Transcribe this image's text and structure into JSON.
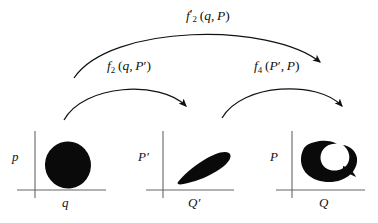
{
  "figure": {
    "background_color": "#ffffff",
    "ink_color": "#000000",
    "axis_color": "#555555"
  },
  "arrows": [
    {
      "name": "arrow-top-f2prime",
      "label_base": "f",
      "label_prime": "′",
      "label_sub": "2",
      "label_args": "(q, P)",
      "label_full": "f′2(q, P)",
      "from_panel": "q-p",
      "to_panel": "Q-P"
    },
    {
      "name": "arrow-left-f2",
      "label_base": "f",
      "label_prime": "",
      "label_sub": "2",
      "label_args": "(q, P′)",
      "label_full": "f2(q, P′)",
      "from_panel": "q-p",
      "to_panel": "Qprime-Pprime"
    },
    {
      "name": "arrow-right-f4",
      "label_base": "f",
      "label_prime": "",
      "label_sub": "4",
      "label_args": "(P′, P)",
      "label_full": "f4(P′, P)",
      "from_panel": "Qprime-Pprime",
      "to_panel": "Q-P"
    }
  ],
  "panels": [
    {
      "name": "panel-q-p",
      "y_axis_label": "p",
      "x_axis_label": "q",
      "blob": "circle",
      "blob_description": "filled round blob"
    },
    {
      "name": "panel-Qprime-Pprime",
      "y_axis_label": "P′",
      "y_axis_label_base": "P",
      "y_axis_label_prime": "′",
      "x_axis_label": "Q′",
      "x_axis_label_base": "Q",
      "x_axis_label_prime": "′",
      "blob": "teardrop",
      "blob_description": "sheared teardrop blob tilted up-right"
    },
    {
      "name": "panel-Q-P",
      "y_axis_label": "P",
      "x_axis_label": "Q",
      "blob": "spiral",
      "blob_description": "filamented spiral / comma-hook blob"
    }
  ]
}
